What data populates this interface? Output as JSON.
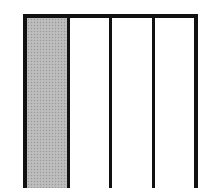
{
  "diagram": {
    "type": "fraction-bar",
    "total_parts": 4,
    "shaded_parts": 1,
    "orientation": "vertical-strips",
    "parts": [
      {
        "index": 0,
        "shaded": true
      },
      {
        "index": 1,
        "shaded": false
      },
      {
        "index": 2,
        "shaded": false
      },
      {
        "index": 3,
        "shaded": false
      }
    ],
    "colors": {
      "border": "#111111",
      "shaded_fill": "#b8b8b8",
      "unshaded_fill": "#ffffff"
    }
  }
}
